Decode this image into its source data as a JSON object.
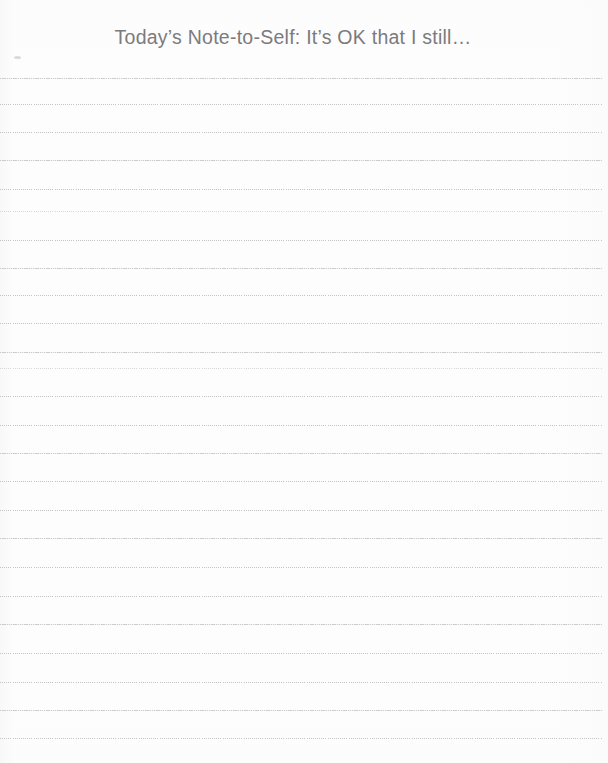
{
  "page": {
    "title": "Today’s Note-to-Self: It’s OK that I still…",
    "background_color": "#fdfdfd",
    "title_color": "#7b7b7d",
    "rule_color": "#bdbdc0",
    "width": 608,
    "height": 763
  },
  "notepad": {
    "line_count": 24,
    "first_line_y": 78,
    "line_spacing": 28.8,
    "line_style": "dotted",
    "lines": [
      {
        "index": 1,
        "y": 78,
        "style": "solidish"
      },
      {
        "index": 2,
        "y": 104,
        "style": "dotted"
      },
      {
        "index": 3,
        "y": 132,
        "style": "dotted"
      },
      {
        "index": 4,
        "y": 160,
        "style": "solidish"
      },
      {
        "index": 5,
        "y": 189,
        "style": "dotted"
      },
      {
        "index": 6,
        "y": 211,
        "style": "faint"
      },
      {
        "index": 7,
        "y": 240,
        "style": "dotted"
      },
      {
        "index": 8,
        "y": 268,
        "style": "solidish"
      },
      {
        "index": 9,
        "y": 295,
        "style": "dotted"
      },
      {
        "index": 10,
        "y": 323,
        "style": "dotted"
      },
      {
        "index": 11,
        "y": 352,
        "style": "solidish"
      },
      {
        "index": 12,
        "y": 368,
        "style": "faint"
      },
      {
        "index": 13,
        "y": 396,
        "style": "dotted"
      },
      {
        "index": 14,
        "y": 425,
        "style": "dotted"
      },
      {
        "index": 15,
        "y": 453,
        "style": "solidish"
      },
      {
        "index": 16,
        "y": 481,
        "style": "dotted"
      },
      {
        "index": 17,
        "y": 510,
        "style": "dotted"
      },
      {
        "index": 18,
        "y": 538,
        "style": "solidish"
      },
      {
        "index": 19,
        "y": 567,
        "style": "dotted"
      },
      {
        "index": 20,
        "y": 596,
        "style": "dotted"
      },
      {
        "index": 21,
        "y": 624,
        "style": "solidish"
      },
      {
        "index": 22,
        "y": 653,
        "style": "dotted"
      },
      {
        "index": 23,
        "y": 682,
        "style": "dotted"
      },
      {
        "index": 24,
        "y": 710,
        "style": "solidish"
      },
      {
        "index": 25,
        "y": 738,
        "style": "dotted"
      }
    ]
  }
}
